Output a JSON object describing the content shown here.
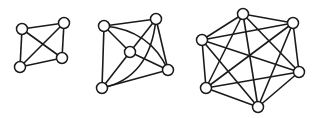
{
  "diagram": {
    "colors": {
      "stroke": "#1a1a1a",
      "node_fill": "#ffffff",
      "background": "#ffffff"
    },
    "node_radius": 5.5,
    "graphs": [
      {
        "name": "K4",
        "nodes": [
          [
            22,
            29
          ],
          [
            64,
            23
          ],
          [
            62,
            58
          ],
          [
            20,
            67
          ]
        ],
        "edges": [
          [
            0,
            1
          ],
          [
            0,
            2
          ],
          [
            0,
            3
          ],
          [
            1,
            2
          ],
          [
            1,
            3
          ],
          [
            2,
            3
          ]
        ],
        "curved_edges": []
      },
      {
        "name": "K5",
        "nodes": [
          [
            104,
            26
          ],
          [
            156,
            19
          ],
          [
            130,
            52
          ],
          [
            168,
            70
          ],
          [
            102,
            88
          ]
        ],
        "edges": [
          [
            0,
            1
          ],
          [
            0,
            2
          ],
          [
            0,
            4
          ],
          [
            1,
            2
          ],
          [
            1,
            3
          ],
          [
            2,
            3
          ],
          [
            2,
            4
          ],
          [
            3,
            4
          ]
        ],
        "curved_edges": [
          {
            "from": 0,
            "to": 3,
            "ctrl": [
              150,
              30
            ]
          },
          {
            "from": 1,
            "to": 4,
            "ctrl": [
              150,
              78
            ]
          }
        ]
      },
      {
        "name": "K6",
        "nodes": [
          [
            243,
            14
          ],
          [
            293,
            23
          ],
          [
            202,
            40
          ],
          [
            299,
            72
          ],
          [
            206,
            88
          ],
          [
            258,
            107
          ]
        ],
        "edges": [
          [
            0,
            1
          ],
          [
            0,
            2
          ],
          [
            0,
            3
          ],
          [
            0,
            4
          ],
          [
            0,
            5
          ],
          [
            1,
            2
          ],
          [
            1,
            3
          ],
          [
            1,
            4
          ],
          [
            1,
            5
          ],
          [
            2,
            3
          ],
          [
            2,
            4
          ],
          [
            2,
            5
          ],
          [
            3,
            4
          ],
          [
            3,
            5
          ],
          [
            4,
            5
          ]
        ],
        "curved_edges": []
      }
    ]
  }
}
